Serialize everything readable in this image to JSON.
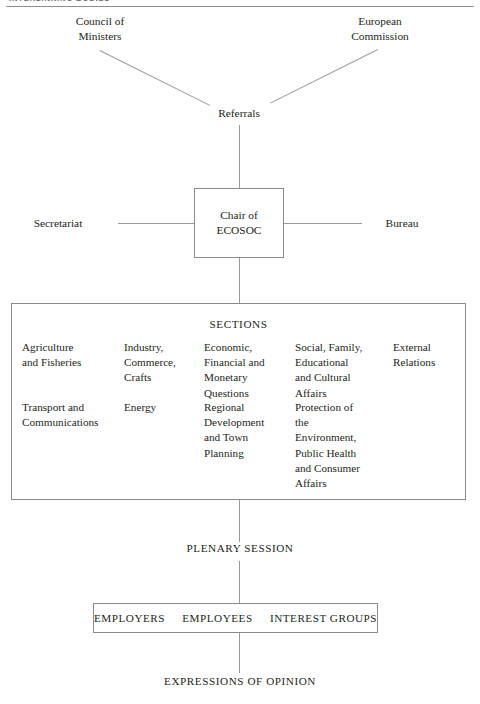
{
  "running_head": {
    "text": "INTERLINKING BODIES",
    "visible": "clipped"
  },
  "diagram": {
    "inputs": [
      {
        "id": "council",
        "label": "Council of\nMinisters"
      },
      {
        "id": "commission",
        "label": "European\nCommission"
      }
    ],
    "referrals": {
      "label": "Referrals"
    },
    "chair": {
      "label": "Chair of\nECOSOC"
    },
    "flanks": [
      {
        "id": "secretariat",
        "label": "Secretariat"
      },
      {
        "id": "bureau",
        "label": "Bureau"
      }
    ],
    "sections": {
      "heading": "SECTIONS",
      "columns": [
        {
          "row1": "Agriculture\nand Fisheries",
          "row2": "Transport and\nCommunications"
        },
        {
          "row1": "Industry,\nCommerce,\nCrafts",
          "row2": "Energy"
        },
        {
          "row1": "Economic,\nFinancial and\nMonetary\nQuestions",
          "row2": "Regional\nDevelopment\nand Town\nPlanning"
        },
        {
          "row1": "Social, Family,\nEducational\nand Cultural\nAffairs",
          "row2": "Protection of\nthe\nEnvironment,\nPublic Health\nand Consumer\nAffairs"
        },
        {
          "row1": "External\nRelations",
          "row2": ""
        }
      ]
    },
    "plenary": {
      "label": "PLENARY SESSION"
    },
    "groups": {
      "items": [
        {
          "id": "employers",
          "label": "EMPLOYERS"
        },
        {
          "id": "employees",
          "label": "EMPLOYEES"
        },
        {
          "id": "interest-groups",
          "label": "INTEREST GROUPS"
        }
      ]
    },
    "output": {
      "label": "EXPRESSIONS OF OPINION"
    }
  },
  "style": {
    "ink": "#231f20",
    "rule": "#8d8d8d",
    "connector": "#9a9a9a",
    "box_border": "#8a8a8a",
    "background": "#ffffff"
  }
}
